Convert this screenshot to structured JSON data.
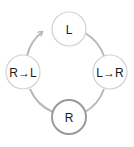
{
  "diagram": {
    "type": "cycle",
    "colors": {
      "ring": "#b8b8b8",
      "node_border": "#cfcfcf",
      "active_node_border": "#9a9a9a",
      "node_fill": "#ffffff",
      "text": "#1a1a1a"
    },
    "nodes": [
      {
        "id": "top",
        "label": "L"
      },
      {
        "id": "right",
        "label": "L→R"
      },
      {
        "id": "bottom",
        "label": "R",
        "active": true
      },
      {
        "id": "left",
        "label": "R→L"
      }
    ],
    "edges": [
      {
        "from": "top",
        "to": "right"
      },
      {
        "from": "right",
        "to": "bottom"
      },
      {
        "from": "bottom",
        "to": "left"
      },
      {
        "from": "left",
        "to": "top",
        "arrow": true
      }
    ]
  }
}
